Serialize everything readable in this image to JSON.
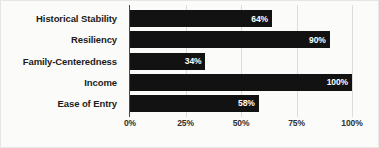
{
  "chart_data": {
    "type": "bar",
    "orientation": "horizontal",
    "title": "",
    "subtitle": "",
    "xlabel": "",
    "ylabel": "",
    "categories": [
      "Historical Stability",
      "Resiliency",
      "Family-Centeredness",
      "Income",
      "Ease of Entry"
    ],
    "values": [
      64,
      90,
      34,
      100,
      58
    ],
    "value_labels": [
      "64%",
      "90%",
      "34%",
      "100%",
      "58%"
    ],
    "xlim": [
      0,
      100
    ],
    "xticks": [
      0,
      25,
      50,
      75,
      100
    ],
    "xtick_labels": [
      "0%",
      "25%",
      "50%",
      "75%",
      "100%"
    ],
    "grid": true,
    "legend": false,
    "legend_position": "none",
    "bar_color": "#121212",
    "value_label_color": "#ffffff",
    "gridline_color": "#dcdcda",
    "axis_color": "#4a4a4a",
    "background_color": "#fbfbfa"
  }
}
